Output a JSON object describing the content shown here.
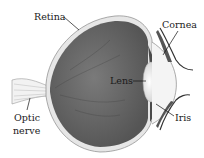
{
  "diagram": {
    "type": "anatomical-eye-cross-section",
    "labels": {
      "retina": "Retina",
      "cornea": "Cornea",
      "lens": "Lens",
      "iris": "Iris",
      "optic_nerve_line1": "Optic",
      "optic_nerve_line2": "nerve"
    },
    "colors": {
      "eyeball_interior": "#6e6e6e",
      "sclera": "#e8e8e8",
      "lens": "#f2f2f2",
      "text": "#1a1a1a"
    }
  }
}
